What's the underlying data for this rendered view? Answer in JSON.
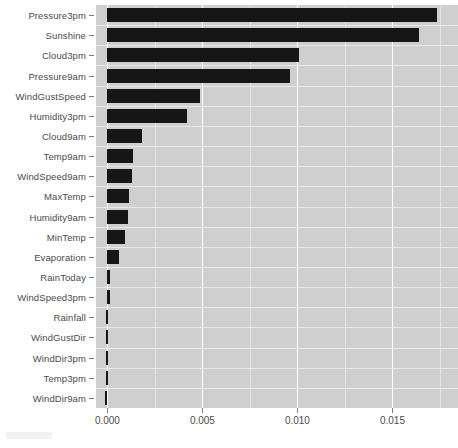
{
  "chart_data": {
    "type": "bar",
    "orientation": "horizontal",
    "title": "",
    "subtitle": "",
    "xlabel": "",
    "ylabel": "",
    "categories": [
      "Pressure3pm",
      "Sunshine",
      "Cloud3pm",
      "Pressure9am",
      "WindGustSpeed",
      "Humidity3pm",
      "Cloud9am",
      "Temp9am",
      "WindSpeed9am",
      "MaxTemp",
      "Humidity9am",
      "MinTemp",
      "Evaporation",
      "RainToday",
      "WindSpeed3pm",
      "Rainfall",
      "WindGustDir",
      "WindDir3pm",
      "Temp3pm",
      "WindDir9am"
    ],
    "values": [
      0.01735,
      0.01642,
      0.0101,
      0.00963,
      0.00489,
      0.00421,
      0.00184,
      0.00137,
      0.00132,
      0.00116,
      0.00106,
      0.00095,
      0.00063,
      0.00016,
      0.0,
      -6e-05,
      -8e-05,
      -8e-05,
      -0.0001,
      -0.00011
    ],
    "xlim": [
      -0.0006,
      0.01845
    ],
    "ylim": [
      -0.5,
      19.5
    ],
    "xticks": [
      0.0,
      0.005,
      0.01,
      0.015
    ],
    "xticklabels": [
      "0.000",
      "0.005",
      "0.010",
      "0.015"
    ],
    "xticks_minor": [
      0.0025,
      0.0075,
      0.0125,
      0.0175
    ],
    "grid": true,
    "legend": null,
    "bar_color": "#161616",
    "panel_color": "#cfcfcf",
    "gridline_major_color": "#ffffff",
    "gridline_minor_color": "#e3e3e3",
    "tick_text_color": "#4a4a4a"
  }
}
